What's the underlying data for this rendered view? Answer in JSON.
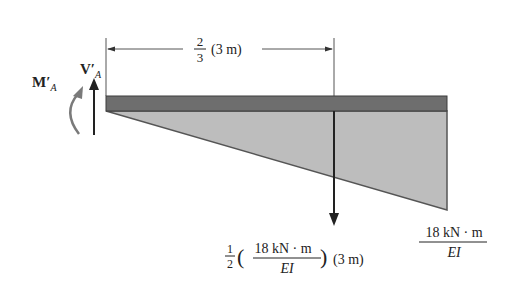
{
  "diagram": {
    "type": "conjugate-beam-moment-diagram",
    "colors": {
      "beam": "#6e6e6e",
      "beam_edge": "#3c3c3c",
      "triangle_fill": "#bdbdbd",
      "triangle_edge": "#555555",
      "arrow": "#222222",
      "moment_arrow": "#7a7a7a",
      "dimension_line": "#555555"
    },
    "reactions": {
      "shear": {
        "symbol": "V",
        "prime": "′",
        "subscript": "A"
      },
      "moment": {
        "symbol": "M",
        "prime": "′",
        "subscript": "A"
      }
    },
    "dimension": {
      "fraction_num": "2",
      "fraction_den": "3",
      "length": "(3 m)"
    },
    "resultant_label": {
      "coef_num": "1",
      "coef_den": "2",
      "open_paren": "(",
      "moment_num": "18 kN · m",
      "moment_den": "EI",
      "close_paren": ")",
      "length": "(3 m)"
    },
    "peak_label": {
      "num": "18 kN · m",
      "den": "EI"
    }
  }
}
